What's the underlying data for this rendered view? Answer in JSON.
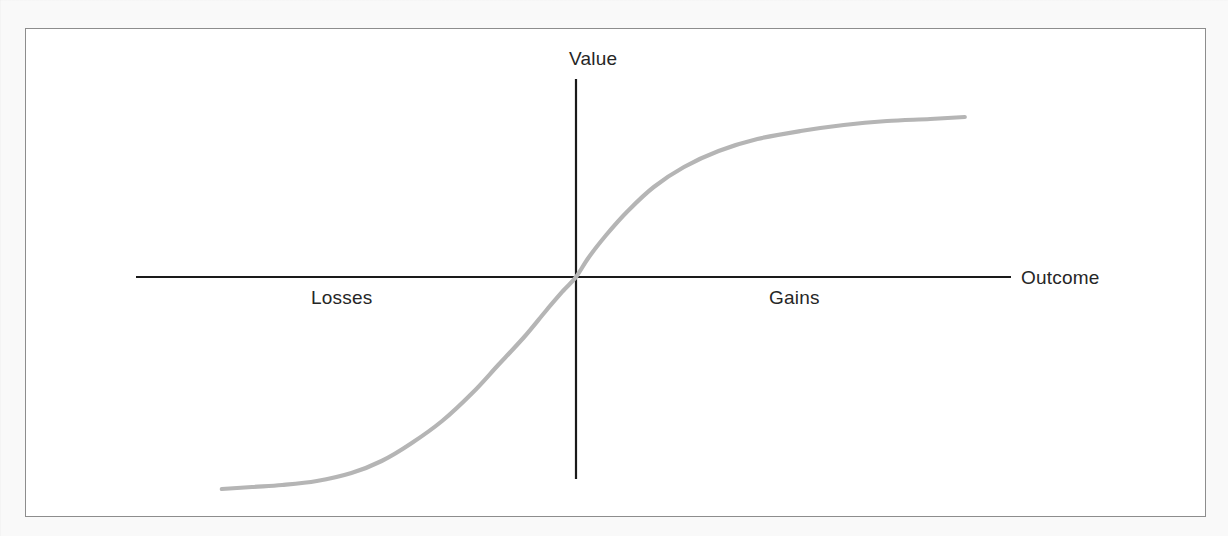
{
  "figure": {
    "caption_title": "Value function",
    "axes": {
      "y_axis_label": "Value",
      "x_axis_label": "Outcome",
      "left_region_label": "Losses",
      "right_region_label": "Gains"
    },
    "colors": {
      "curve": "#b5b5b5",
      "axis": "#1a1a1a",
      "frame_border": "#8d8d8d",
      "plot_background": "#ffffff",
      "page_background": "#f9f9f9",
      "label_text": "#262626"
    }
  },
  "chart_data": {
    "type": "line",
    "title": "",
    "xlabel": "Outcome",
    "ylabel": "Value",
    "grid": false,
    "legend": null,
    "annotations": [
      {
        "text": "Losses",
        "x": -0.62,
        "y": -0.12,
        "position": "below-left-axis"
      },
      {
        "text": "Gains",
        "x": 0.45,
        "y": -0.12,
        "position": "below-right-axis"
      },
      {
        "text": "Value",
        "x": 0.0,
        "y": 1.12,
        "position": "above-y-axis"
      },
      {
        "text": "Outcome",
        "x": 1.12,
        "y": 0.0,
        "position": "right-of-x-axis"
      }
    ],
    "xlim": [
      -1.0,
      1.0
    ],
    "ylim": [
      -1.0,
      1.0
    ],
    "axis_crossing": {
      "x": 0.0,
      "y": 0.0
    },
    "series": [
      {
        "name": "Value function v(x)",
        "color": "#b5b5b5",
        "x": [
          -0.82,
          -0.75,
          -0.68,
          -0.6,
          -0.52,
          -0.45,
          -0.38,
          -0.31,
          -0.24,
          -0.18,
          -0.12,
          -0.07,
          -0.03,
          0.0,
          0.03,
          0.07,
          0.12,
          0.18,
          0.25,
          0.33,
          0.42,
          0.52,
          0.62,
          0.72,
          0.82,
          0.9
        ],
        "y": [
          -1.06,
          -1.05,
          -1.04,
          -1.02,
          -0.98,
          -0.92,
          -0.83,
          -0.72,
          -0.58,
          -0.44,
          -0.3,
          -0.17,
          -0.07,
          0.0,
          0.1,
          0.21,
          0.33,
          0.45,
          0.55,
          0.63,
          0.69,
          0.73,
          0.76,
          0.78,
          0.79,
          0.8
        ]
      }
    ]
  }
}
